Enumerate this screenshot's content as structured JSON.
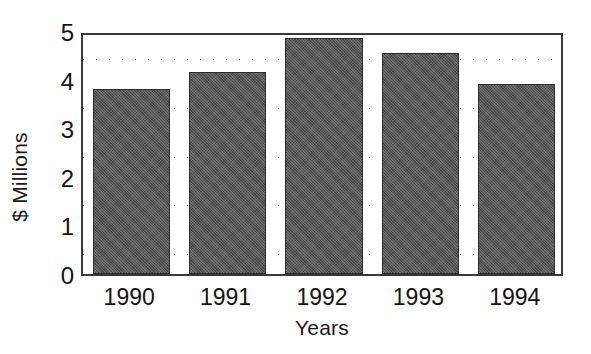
{
  "chart_data": {
    "type": "bar",
    "title": "",
    "categories": [
      "1990",
      "1991",
      "1992",
      "1993",
      "1994"
    ],
    "values": [
      3.8,
      4.15,
      4.85,
      4.55,
      3.9
    ],
    "xlabel": "Years",
    "ylabel": "$ Millions",
    "ylim": [
      0,
      5
    ],
    "xlim": [
      0,
      5
    ],
    "ytick_labels": [
      "0",
      "1",
      "2",
      "3",
      "4",
      "5"
    ],
    "ytick_values": [
      0,
      1,
      2,
      3,
      4,
      5
    ],
    "gridlines": {
      "horizontal": true,
      "vertical": false,
      "style": "dotted",
      "values": [
        0.5,
        1.5,
        2.5,
        3.5,
        4.5
      ]
    },
    "legend": null,
    "colors": {
      "bar_fill": "#565656",
      "bar_edge": "#2e2e2e",
      "axis": "#3a3a3a",
      "text": "#141414",
      "grid": "#6e6e6e",
      "background": "#ffffff"
    }
  }
}
